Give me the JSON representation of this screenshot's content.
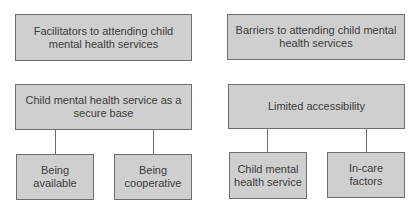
{
  "diagram": {
    "colors": {
      "box_fill": "#cfcfcf",
      "box_border": "#6e6e6e",
      "text": "#3c3c3c",
      "connector": "#6e6e6e",
      "background": "#ffffff"
    },
    "left_column": {
      "header": "Facilitators to attending child mental health services",
      "theme": "Child mental health service as a secure base",
      "subthemes": [
        {
          "label": "Being available"
        },
        {
          "label": "Being cooperative"
        }
      ]
    },
    "right_column": {
      "header": "Barriers to attending child mental health services",
      "theme": "Limited accessibility",
      "subthemes": [
        {
          "label": "Child mental health service"
        },
        {
          "label": "In-care factors"
        }
      ]
    }
  }
}
